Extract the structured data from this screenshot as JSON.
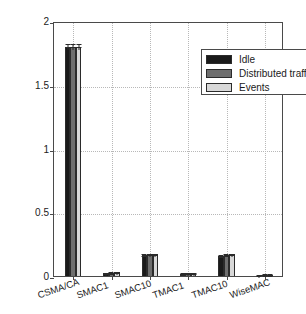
{
  "chart_data": {
    "type": "bar",
    "title": "",
    "subtitle": "",
    "xlabel": "",
    "ylabel": "Average power [mW]",
    "categories": [
      "CSMA/CA",
      "SMAC1",
      "SMAC10",
      "TMAC1",
      "TMAC10",
      "WiseMAC"
    ],
    "series": [
      {
        "name": "Idle",
        "color": "#1a1a1a",
        "values": [
          1.8,
          0.022,
          0.165,
          0.018,
          0.16,
          0.006
        ],
        "errors": [
          0.02,
          0.004,
          0.008,
          0.004,
          0.008,
          0.002
        ]
      },
      {
        "name": "Distributed traffic",
        "color": "#6e6e6e",
        "values": [
          1.8,
          0.026,
          0.17,
          0.02,
          0.168,
          0.008
        ],
        "errors": [
          0.02,
          0.005,
          0.01,
          0.004,
          0.01,
          0.002
        ]
      },
      {
        "name": "Events",
        "color": "#d8d8d8",
        "values": [
          1.8,
          0.03,
          0.172,
          0.022,
          0.172,
          0.009
        ],
        "errors": [
          0.02,
          0.006,
          0.01,
          0.005,
          0.01,
          0.003
        ]
      }
    ],
    "ylim": [
      0,
      2
    ],
    "yticks": [
      0,
      0.5,
      1,
      1.5,
      2
    ],
    "ytick_labels": [
      "0",
      "0.5",
      "1",
      "1.5",
      "2"
    ],
    "grid": true,
    "grid_style": "dotted",
    "legend_position": "top-right",
    "errorbars": true
  },
  "legend": {
    "entries": [
      {
        "label": "Idle"
      },
      {
        "label": "Distributed traffic"
      },
      {
        "label": "Events"
      }
    ]
  }
}
